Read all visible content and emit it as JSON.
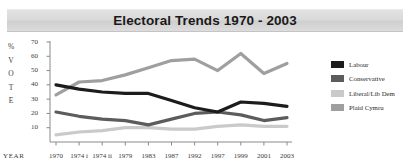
{
  "title": "Electoral Trends 1970 - 2003",
  "axis": {
    "y_title_chars": [
      "%",
      "V",
      "O",
      "T",
      "E"
    ],
    "x_title": "YEAR"
  },
  "legend": {
    "items": [
      {
        "label": "Labour",
        "color": "#1c1c1c"
      },
      {
        "label": "Conservative",
        "color": "#5c5c5c"
      },
      {
        "label": "Liberal/Lib Dem",
        "color": "#cacaca"
      },
      {
        "label": "Plaid Cymru",
        "color": "#9f9f9f"
      }
    ]
  },
  "chart_data": {
    "type": "line",
    "title": "Electoral Trends 1970 - 2003",
    "xlabel": "YEAR",
    "ylabel": "% VOTE",
    "categories": [
      "1970",
      "1974 i",
      "1974 ii",
      "1979",
      "1983",
      "1987",
      "1992",
      "1997",
      "1999",
      "2001",
      "2003"
    ],
    "yticks": [
      0,
      10,
      20,
      30,
      40,
      50,
      60,
      70
    ],
    "ylim": [
      0,
      70
    ],
    "grid": false,
    "legend_position": "right",
    "series": [
      {
        "name": "Labour",
        "color": "#1c1c1c",
        "values": [
          40,
          37,
          35,
          34,
          34,
          29,
          24,
          21,
          28,
          27,
          25
        ]
      },
      {
        "name": "Conservative",
        "color": "#5c5c5c",
        "values": [
          21,
          18,
          16,
          15,
          12,
          16,
          20,
          21,
          19,
          15,
          17
        ]
      },
      {
        "name": "Liberal/Lib Dem",
        "color": "#cacaca",
        "values": [
          5,
          7,
          8,
          10,
          10,
          9,
          9,
          11,
          12,
          11,
          11
        ]
      },
      {
        "name": "Plaid Cymru",
        "color": "#9f9f9f",
        "values": [
          33,
          42,
          43,
          47,
          52,
          57,
          58,
          50,
          62,
          48,
          55
        ]
      }
    ]
  }
}
